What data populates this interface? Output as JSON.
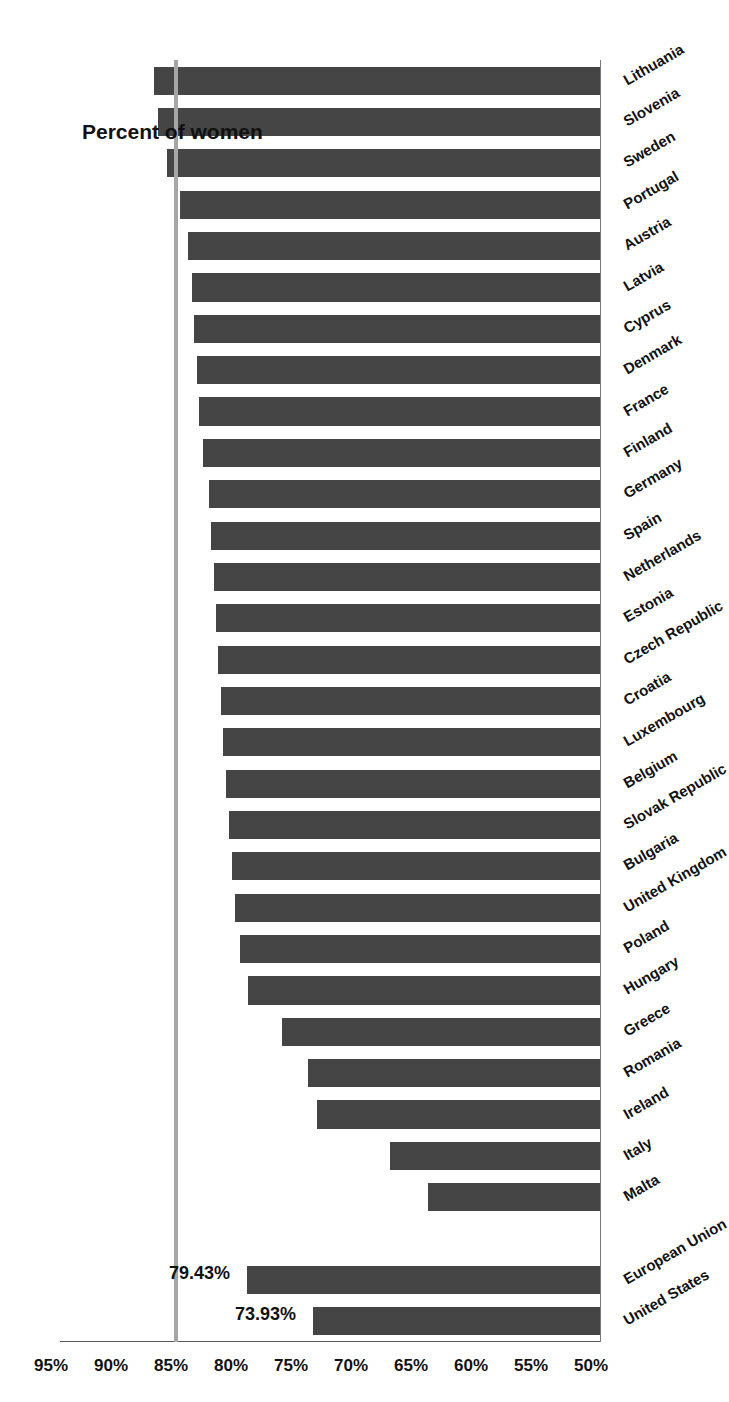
{
  "chart_data": {
    "type": "bar",
    "orientation": "horizontal",
    "title": "",
    "xlabel": "",
    "ylabel": "Percent of women",
    "axis_title": "Percent of women",
    "xlim": [
      50,
      95
    ],
    "ylim": [
      50,
      95
    ],
    "grid": true,
    "legend": false,
    "tick_labels": [
      "95%",
      "90%",
      "85%",
      "80%",
      "75%",
      "70%",
      "65%",
      "60%",
      "55%",
      "50%"
    ],
    "tick_values": [
      95,
      90,
      85,
      80,
      75,
      70,
      65,
      60,
      55,
      50
    ],
    "axis_direction": "descending",
    "baseline_value": 50,
    "bar_color": "#454545",
    "reference_line": {
      "value": 85.5,
      "color": "#a6a6a6",
      "label": ""
    },
    "categories": [
      "United States",
      "European Union",
      "",
      "Malta",
      "Italy",
      "Ireland",
      "Romania",
      "Greece",
      "Hungary",
      "Poland",
      "United Kingdom",
      "Bulgaria",
      "Slovak Republic",
      "Belgium",
      "Luxembourg",
      "Croatia",
      "Czech Republic",
      "Estonia",
      "Netherlands",
      "Spain",
      "Germany",
      "Finland",
      "France",
      "Denmark",
      "Cyprus",
      "Latvia",
      "Austria",
      "Portugal",
      "Sweden",
      "Slovenia",
      "Lithuania"
    ],
    "values": [
      73.93,
      79.43,
      null,
      64.3,
      67.5,
      73.6,
      74.3,
      76.5,
      79.3,
      80.0,
      80.4,
      80.7,
      80.9,
      81.2,
      81.4,
      81.6,
      81.8,
      82.0,
      82.2,
      82.4,
      82.6,
      83.1,
      83.4,
      83.6,
      83.8,
      84.0,
      84.3,
      85.0,
      86.1,
      86.8,
      87.2
    ],
    "data_labels": [
      {
        "category": "United States",
        "value": 73.93,
        "text": "73.93%"
      },
      {
        "category": "European Union",
        "value": 79.43,
        "text": "79.43%"
      }
    ]
  }
}
